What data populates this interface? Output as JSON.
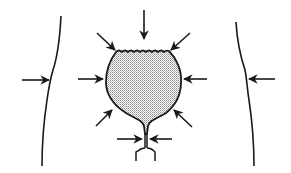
{
  "diagram": {
    "colors": {
      "line": "#1a1a1a",
      "fill": "#d4d4d4",
      "background": "#ffffff"
    },
    "elements": {
      "left_wall": "abdominal-wall-left",
      "right_wall": "abdominal-wall-right",
      "bladder": "bladder-shape",
      "urethra": "urethra-neck",
      "arrow_count": 10
    }
  }
}
